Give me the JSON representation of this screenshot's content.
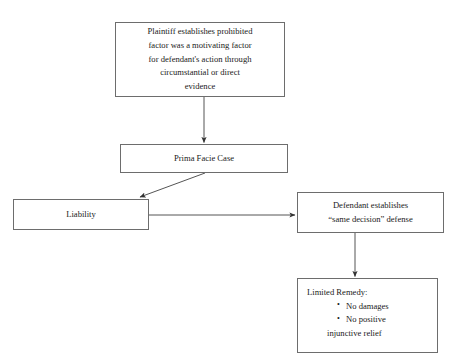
{
  "page": {
    "title_partial": "MIXED MOTIVE CASE ANALYSIS",
    "background_color": "#ffffff",
    "line_color": "#555555",
    "border_color": "#6d6d6d"
  },
  "nodes": {
    "prohibited_factor": {
      "id": "prohibited-factor",
      "lines": [
        "Plaintiff establishes prohibited",
        "factor was a motivating factor",
        "for defendant's action through",
        "circumstantial or direct",
        "evidence"
      ]
    },
    "prima_facie": {
      "id": "prima-facie",
      "lines": [
        "Prima Facie Case"
      ]
    },
    "liability": {
      "id": "liability",
      "lines": [
        "Liability"
      ]
    },
    "same_decision": {
      "id": "same-decision",
      "lines": [
        "Defendant establishes",
        "“same decision” defense"
      ]
    },
    "limited_remedy": {
      "id": "limited-remedy",
      "heading": "Limited Remedy:",
      "bullets": [
        "No damages",
        "No positive"
      ],
      "continuation": "injunctive relief"
    }
  },
  "edges": [
    {
      "id": "prohibited-to-prima-facie",
      "from": "prohibited_factor",
      "to": "prima_facie",
      "style": "vertical-arrow"
    },
    {
      "id": "prima-facie-to-liability",
      "from": "prima_facie",
      "to": "liability",
      "style": "diagonal-arrow"
    },
    {
      "id": "liability-to-same-decision",
      "from": "liability",
      "to": "same_decision",
      "style": "horizontal-arrow"
    },
    {
      "id": "same-decision-to-limited-remedy",
      "from": "same_decision",
      "to": "limited_remedy",
      "style": "vertical-arrow"
    }
  ]
}
